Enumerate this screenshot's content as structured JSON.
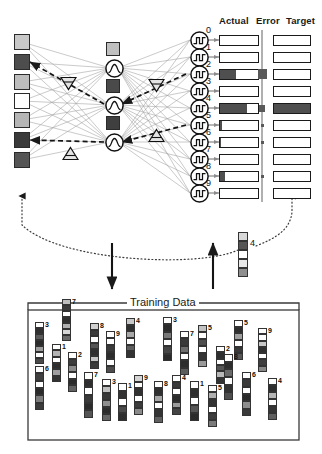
{
  "figure": {
    "title": "Training Data",
    "columns": {
      "actual": "Actual",
      "error": "Error",
      "target": "Target"
    },
    "feedback_sample_label": "4"
  },
  "input_layer": {
    "name": "input-units",
    "units": [
      {
        "shade": "#c8c8c8"
      },
      {
        "shade": "#4d4d4d"
      },
      {
        "shade": "#bdbdbd"
      },
      {
        "shade": "#ffffff"
      },
      {
        "shade": "#b5b5b5"
      },
      {
        "shade": "#3a3a3a"
      },
      {
        "shade": "#555555"
      }
    ]
  },
  "hidden_layer": {
    "name": "hidden-units",
    "activation_icon": "sigmoid-icon",
    "units": [
      {
        "shade": "#c0c0c0"
      },
      {
        "shade": "#4a4a4a"
      },
      {
        "shade": "#3f3f3f"
      }
    ]
  },
  "output_layer": {
    "name": "output-units",
    "activation_icon": "step-function-icon",
    "units": [
      {
        "digit": "0",
        "actual": 0.0,
        "error": 0.0,
        "target": 0.0
      },
      {
        "digit": "1",
        "actual": 0.0,
        "error": 0.0,
        "target": 0.0
      },
      {
        "digit": "2",
        "actual": 0.42,
        "error": 0.42,
        "target": 0.0
      },
      {
        "digit": "3",
        "actual": 0.0,
        "error": 0.0,
        "target": 0.0
      },
      {
        "digit": "4",
        "actual": 0.72,
        "error": 0.28,
        "target": 1.0
      },
      {
        "digit": "5",
        "actual": 0.04,
        "error": 0.1,
        "target": 0.0
      },
      {
        "digit": "6",
        "actual": 0.03,
        "error": 0.09,
        "target": 0.0
      },
      {
        "digit": "7",
        "actual": 0.0,
        "error": 0.0,
        "target": 0.0
      },
      {
        "digit": "8",
        "actual": 0.12,
        "error": 0.12,
        "target": 0.0
      },
      {
        "digit": "9",
        "actual": 0.0,
        "error": 0.0,
        "target": 0.0
      }
    ]
  },
  "backprop": {
    "marker_icons": [
      "triangle-down-icon",
      "triangle-down-icon",
      "triangle-up-icon",
      "triangle-up-icon"
    ]
  },
  "feedback_sample": {
    "label": "4",
    "segments": [
      "#d8d8d8",
      "#555555",
      "#ffffff",
      "#e8e8e8",
      "#8f8f8f"
    ]
  },
  "training_data": {
    "title": "Training Data",
    "samples": [
      {
        "label": "7",
        "x": 62,
        "y": 299,
        "w": 9,
        "h": 42,
        "segments": [
          "#bdbdbd",
          "#3a3a3a",
          "#ffffff",
          "#2f2f2f",
          "#b0b0b0",
          "#d6d6d6",
          "#6b6b6b"
        ]
      },
      {
        "label": "3",
        "x": 35,
        "y": 322,
        "w": 9,
        "h": 42,
        "segments": [
          "#ffffff",
          "#303030",
          "#5a5a5a",
          "#2a2a2a",
          "#9d9d9d",
          "#ffffff",
          "#4a4a4a"
        ]
      },
      {
        "label": "8",
        "x": 90,
        "y": 323,
        "w": 9,
        "h": 46,
        "segments": [
          "#d0d0d0",
          "#3c3c3c",
          "#ffffff",
          "#555555",
          "#2e2e2e",
          "#c4c4c4",
          "#3a3a3a"
        ]
      },
      {
        "label": "4",
        "x": 126,
        "y": 318,
        "w": 9,
        "h": 40,
        "segments": [
          "#c8c8c8",
          "#2f2f2f",
          "#a8a8a8",
          "#ffffff",
          "#5e5e5e",
          "#333333"
        ]
      },
      {
        "label": "3",
        "x": 163,
        "y": 317,
        "w": 9,
        "h": 44,
        "segments": [
          "#ffffff",
          "#2b2b2b",
          "#787878",
          "#ffffff",
          "#454545",
          "#2a2a2a"
        ]
      },
      {
        "label": "5",
        "x": 198,
        "y": 325,
        "w": 9,
        "h": 42,
        "segments": [
          "#c2c2c2",
          "#ffffff",
          "#4f4f4f",
          "#ffffff",
          "#343434",
          "#9a9a9a"
        ]
      },
      {
        "label": "5",
        "x": 234,
        "y": 320,
        "w": 9,
        "h": 40,
        "segments": [
          "#ffffff",
          "#2e2e2e",
          "#9e9e9e",
          "#ffffff",
          "#3a3a3a",
          "#565656"
        ]
      },
      {
        "label": "9",
        "x": 106,
        "y": 331,
        "w": 9,
        "h": 42,
        "segments": [
          "#ffffff",
          "#ffffff",
          "#3b3b3b",
          "#2c2c2c",
          "#ffffff",
          "#4d4d4d"
        ]
      },
      {
        "label": "9",
        "x": 258,
        "y": 328,
        "w": 9,
        "h": 44,
        "segments": [
          "#ffffff",
          "#ffffff",
          "#c8c8c8",
          "#303030",
          "#ffffff",
          "#3e3e3e",
          "#888888"
        ]
      },
      {
        "label": "7",
        "x": 180,
        "y": 331,
        "w": 9,
        "h": 44,
        "segments": [
          "#ffffff",
          "#3a3a3a",
          "#6e6e6e",
          "#ffffff",
          "#2d2d2d",
          "#5c5c5c"
        ]
      },
      {
        "label": "1",
        "x": 52,
        "y": 344,
        "w": 9,
        "h": 38,
        "segments": [
          "#ffffff",
          "#b4b4b4",
          "#ffffff",
          "#2e2e2e",
          "#9f9f9f",
          "#333333"
        ]
      },
      {
        "label": "2",
        "x": 68,
        "y": 352,
        "w": 9,
        "h": 40,
        "segments": [
          "#ffffff",
          "#3d3d3d",
          "#8c8c8c",
          "#ffffff",
          "#2b2b2b",
          "#616161"
        ]
      },
      {
        "label": "2",
        "x": 216,
        "y": 346,
        "w": 9,
        "h": 38,
        "segments": [
          "#ffffff",
          "#2f2f2f",
          "#ffffff",
          "#555555",
          "#b8b8b8",
          "#333333"
        ]
      },
      {
        "label": "6",
        "x": 35,
        "y": 366,
        "w": 9,
        "h": 44,
        "segments": [
          "#ffffff",
          "#404040",
          "#ffffff",
          "#2a2a2a",
          "#7c7c7c",
          "#3b3b3b"
        ]
      },
      {
        "label": "7",
        "x": 84,
        "y": 372,
        "w": 9,
        "h": 46,
        "segments": [
          "#ffffff",
          "#2e2e2e",
          "#ffffff",
          "#3a3a3a",
          "#2b2b2b",
          "#555555"
        ]
      },
      {
        "label": "3",
        "x": 102,
        "y": 379,
        "w": 9,
        "h": 42,
        "segments": [
          "#ffffff",
          "#c0c0c0",
          "#383838",
          "#8e8e8e",
          "#2c2c2c",
          "#666666"
        ]
      },
      {
        "label": "1",
        "x": 118,
        "y": 383,
        "w": 9,
        "h": 38,
        "segments": [
          "#ffffff",
          "#333333",
          "#ffffff",
          "#4a4a4a",
          "#2d2d2d"
        ]
      },
      {
        "label": "9",
        "x": 134,
        "y": 375,
        "w": 9,
        "h": 40,
        "segments": [
          "#d4d4d4",
          "#ffffff",
          "#323232",
          "#ffffff",
          "#3c3c3c",
          "#8a8a8a"
        ]
      },
      {
        "label": "8",
        "x": 154,
        "y": 381,
        "w": 9,
        "h": 42,
        "segments": [
          "#ffffff",
          "#2f2f2f",
          "#a6a6a6",
          "#ffffff",
          "#343434",
          "#606060"
        ]
      },
      {
        "label": "4",
        "x": 172,
        "y": 375,
        "w": 9,
        "h": 40,
        "segments": [
          "#ffffff",
          "#3a3a3a",
          "#ffffff",
          "#2c2c2c",
          "#9c9c9c",
          "#444444"
        ]
      },
      {
        "label": "1",
        "x": 190,
        "y": 381,
        "w": 9,
        "h": 40,
        "segments": [
          "#ffffff",
          "#2e2e2e",
          "#ffffff",
          "#565656",
          "#2b2b2b"
        ]
      },
      {
        "label": "5",
        "x": 208,
        "y": 385,
        "w": 9,
        "h": 42,
        "segments": [
          "#ffffff",
          "#b0b0b0",
          "#343434",
          "#ffffff",
          "#3d3d3d",
          "#7a7a7a"
        ]
      },
      {
        "label": "8",
        "x": 224,
        "y": 354,
        "w": 9,
        "h": 46,
        "segments": [
          "#ffffff",
          "#2d2d2d",
          "#6a6a6a",
          "#ffffff",
          "#323232",
          "#4e4e4e"
        ]
      },
      {
        "label": "6",
        "x": 242,
        "y": 372,
        "w": 9,
        "h": 44,
        "segments": [
          "#ffffff",
          "#3c3c3c",
          "#ffffff",
          "#2a2a2a",
          "#8d8d8d",
          "#3a3a3a"
        ]
      },
      {
        "label": "4",
        "x": 268,
        "y": 378,
        "w": 9,
        "h": 42,
        "segments": [
          "#ffffff",
          "#2e2e2e",
          "#b6b6b6",
          "#ffffff",
          "#353535",
          "#5f5f5f"
        ]
      }
    ]
  }
}
